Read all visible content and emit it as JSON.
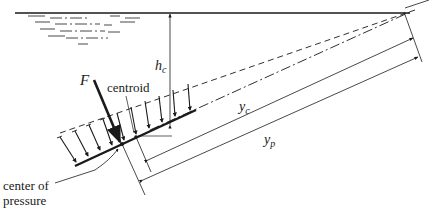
{
  "diagram": {
    "labels": {
      "force": "F",
      "force_sub": "",
      "centroid": "centroid",
      "hc_main": "h",
      "hc_sub": "c",
      "yc_main": "y",
      "yc_sub": "c",
      "yp_main": "y",
      "yp_sub": "p",
      "cop_line1": "center of",
      "cop_line2": "pressure"
    },
    "colors": {
      "stroke": "#1a1a1a",
      "background": "#ffffff"
    }
  }
}
